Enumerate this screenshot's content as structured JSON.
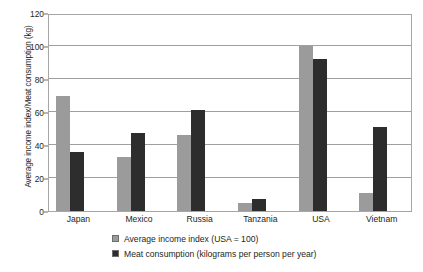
{
  "chart_data": {
    "type": "bar",
    "title": "",
    "xlabel": "",
    "ylabel": "Average income index/Meat consumption (kg)",
    "ylim": [
      0,
      120
    ],
    "yticks": [
      0,
      20,
      40,
      60,
      80,
      100,
      120
    ],
    "ytick_labels": [
      "0",
      "20",
      "40",
      "60",
      "80",
      "100",
      "120"
    ],
    "grid": true,
    "legend_position": "bottom",
    "categories": [
      "Japan",
      "Mexico",
      "Russia",
      "Tanzania",
      "USA",
      "Vietnam"
    ],
    "series": [
      {
        "name": "Average income index (USA = 100)",
        "color": "#9b9b9b",
        "values": [
          70,
          33,
          46,
          5,
          100,
          11
        ]
      },
      {
        "name": "Meat consumption (kilograms per person per year)",
        "color": "#2d2d2d",
        "values": [
          36,
          47,
          61,
          7,
          92,
          51
        ]
      }
    ]
  },
  "legend": {
    "items": [
      {
        "label": "Average income index (USA = 100)"
      },
      {
        "label": "Meat consumption (kilograms per person per year)"
      }
    ]
  }
}
